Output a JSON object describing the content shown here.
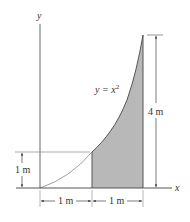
{
  "figure": {
    "curve": {
      "equation_label": "y = x",
      "exponent": "2"
    },
    "axes": {
      "x_label": "x",
      "y_label": "y"
    },
    "dimensions": {
      "left_height": "1 m",
      "right_height": "4 m",
      "bottom_left_width": "1 m",
      "bottom_right_width": "1 m"
    },
    "colors": {
      "line": "#555555",
      "thin_line": "#888888",
      "shaded_fill": "#b8b8b8",
      "text": "#333333"
    }
  }
}
